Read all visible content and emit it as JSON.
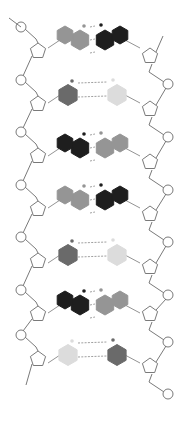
{
  "diagram": {
    "colors": {
      "G": "#1e1e1e",
      "C": "#6a6a6a",
      "A": "#959595",
      "T": "#dcdcdc",
      "backbone": "#6a6a6a",
      "hbond": "#888888"
    },
    "base_pairs": [
      {
        "y": 40,
        "left": "A",
        "right": "G",
        "bonds": 3
      },
      {
        "y": 95,
        "left": "C",
        "right": "T",
        "bonds": 2
      },
      {
        "y": 148,
        "left": "G",
        "right": "A",
        "bonds": 3
      },
      {
        "y": 200,
        "left": "A",
        "right": "G",
        "bonds": 3
      },
      {
        "y": 255,
        "left": "C",
        "right": "T",
        "bonds": 2
      },
      {
        "y": 305,
        "left": "G",
        "right": "A",
        "bonds": 3
      },
      {
        "y": 355,
        "left": "T",
        "right": "C",
        "bonds": 2
      }
    ],
    "left_phosphates_y": [
      27,
      80,
      132,
      185,
      237,
      290,
      335
    ],
    "right_phosphates_y": [
      84,
      137,
      190,
      242,
      295,
      342,
      394
    ]
  }
}
